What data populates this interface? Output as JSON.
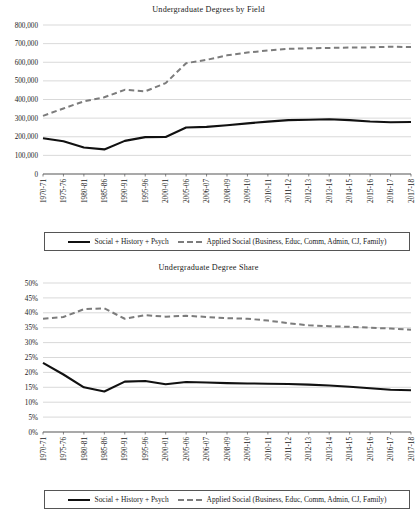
{
  "figure": {
    "background": "#ffffff",
    "series_colors": {
      "solid": "#111111",
      "dashed": "#7c7c7c"
    },
    "gridline_color": "#c9c9c9",
    "axis_color": "#555555"
  },
  "legend": {
    "entries": [
      {
        "label": "Social + History + Psych",
        "style": "solid",
        "icon": "solid-line-swatch"
      },
      {
        "label": "Applied Social (Business, Educ, Comm, Admin, CJ, Family)",
        "style": "dashed",
        "icon": "dashed-line-swatch"
      }
    ]
  },
  "chart_data": [
    {
      "id": "undergraduate-degrees-by-field",
      "type": "line",
      "title": "Undergraduate Degrees by Field",
      "xlabel": "",
      "ylabel": "",
      "ylim": [
        0,
        800000
      ],
      "ytick_step": 100000,
      "grid": true,
      "legend_position": "bottom",
      "ytick_labels": [
        "0",
        "100,000",
        "200,000",
        "300,000",
        "400,000",
        "500,000",
        "600,000",
        "700,000",
        "800,000"
      ],
      "categories": [
        "1970-71",
        "1975-76",
        "1980-81",
        "1985-86",
        "1990-91",
        "1995-96",
        "2000-01",
        "2005-06",
        "2006-07",
        "2008-09",
        "2009-10",
        "2010-11",
        "2011-12",
        "2012-13",
        "2013-14",
        "2014-15",
        "2015-16",
        "2016-17",
        "2017-18"
      ],
      "series": [
        {
          "name": "Social + History + Psych",
          "style": "solid",
          "values": [
            192000,
            176000,
            142000,
            132000,
            178000,
            198000,
            199000,
            250000,
            253000,
            262000,
            272000,
            281000,
            289000,
            291000,
            294000,
            289000,
            282000,
            278000,
            279000
          ]
        },
        {
          "name": "Applied Social (Business, Educ, Comm, Admin, CJ, Family)",
          "style": "dashed",
          "values": [
            312000,
            352000,
            390000,
            412000,
            452000,
            444000,
            488000,
            595000,
            613000,
            637000,
            652000,
            663000,
            672000,
            675000,
            677000,
            679000,
            680000,
            683000,
            682000
          ]
        }
      ]
    },
    {
      "id": "undergraduate-degree-share",
      "type": "line",
      "title": "Undergraduate Degree Share",
      "xlabel": "",
      "ylabel": "",
      "ylim": [
        0,
        50
      ],
      "ytick_step": 5,
      "grid": true,
      "legend_position": "bottom",
      "ytick_labels": [
        "0%",
        "5%",
        "10%",
        "15%",
        "20%",
        "25%",
        "30%",
        "35%",
        "40%",
        "45%",
        "50%"
      ],
      "categories": [
        "1970-71",
        "1975-76",
        "1980-81",
        "1985-86",
        "1990-91",
        "1995-96",
        "2000-01",
        "2005-06",
        "2006-07",
        "2008-09",
        "2009-10",
        "2010-11",
        "2011-12",
        "2012-13",
        "2013-14",
        "2014-15",
        "2015-16",
        "2016-17",
        "2017-18"
      ],
      "series": [
        {
          "name": "Social + History + Psych",
          "style": "solid",
          "values": [
            23.2,
            19.3,
            15.0,
            13.6,
            16.9,
            17.1,
            16.0,
            16.8,
            16.6,
            16.4,
            16.3,
            16.2,
            16.1,
            15.9,
            15.6,
            15.2,
            14.7,
            14.2,
            14.0
          ]
        },
        {
          "name": "Applied Social (Business, Educ, Comm, Admin, CJ, Family)",
          "style": "dashed",
          "values": [
            38.0,
            38.6,
            41.2,
            41.5,
            38.0,
            39.2,
            38.7,
            39.0,
            38.6,
            38.2,
            38.0,
            37.4,
            36.5,
            35.8,
            35.5,
            35.3,
            35.0,
            34.7,
            34.3
          ]
        }
      ]
    }
  ]
}
